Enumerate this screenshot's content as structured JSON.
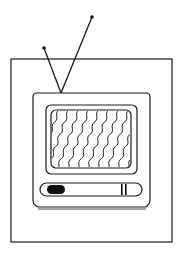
{
  "illustration": {
    "subject": "television-icon",
    "colors": {
      "stroke": "#1a1a1a",
      "fill": "#ffffff",
      "knob": "#111111"
    },
    "parts": [
      "outer-frame",
      "antenna-left",
      "antenna-right",
      "tv-body",
      "screen",
      "static-waves",
      "control-bar",
      "knob",
      "buttons"
    ]
  }
}
